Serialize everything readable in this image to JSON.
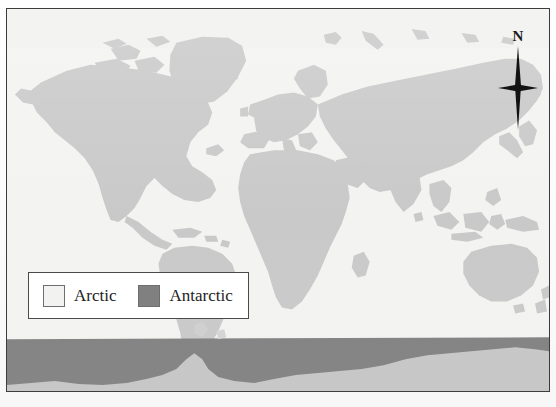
{
  "figure": {
    "type": "world-map",
    "projection": "equirectangular",
    "frame": {
      "border_color": "#3c3c3c"
    },
    "background_color": "#f3f3f1"
  },
  "compass": {
    "north_label": "N",
    "icon": "compass-star-icon",
    "color": "#121212"
  },
  "legend": {
    "background_color": "#ffffff",
    "border_color": "#4a4a4a",
    "items": [
      {
        "label": "Arctic",
        "color": "#f2f2f0",
        "swatch": "arctic-swatch"
      },
      {
        "label": "Antarctic",
        "color": "#808080",
        "swatch": "antarctic-swatch"
      }
    ]
  },
  "map": {
    "ocean_color": "#f3f3f1",
    "land_color": "#c9c9c9",
    "arctic_color": "#f0f0ee",
    "antarctic_band_color": "#808080",
    "antarctic_land_color": "#c6c6c6",
    "regions": [
      "North America",
      "Greenland",
      "South America",
      "Europe",
      "Africa",
      "Asia",
      "Australia",
      "Antarctica"
    ]
  }
}
